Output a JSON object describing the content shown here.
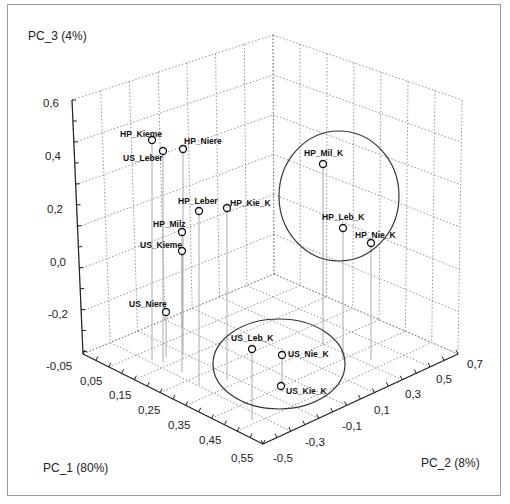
{
  "chart_data": {
    "type": "scatter3d",
    "title": "",
    "axes": {
      "x": {
        "label": "PC_1  (80%)",
        "ticks": [
          "-0,05",
          "0,05",
          "0,15",
          "0,25",
          "0,35",
          "0,45",
          "0,55"
        ],
        "range": [
          -0.05,
          0.6
        ]
      },
      "y": {
        "label": "PC_2  (8%)",
        "ticks": [
          "-0,5",
          "-0,3",
          "-0,1",
          "0,1",
          "0,3",
          "0,5",
          "0,7"
        ],
        "range": [
          -0.5,
          0.8
        ]
      },
      "z": {
        "label": "PC_3  (4%)",
        "ticks": [
          "0,6",
          "0,4",
          "0,2",
          "0,0",
          "-0,2"
        ],
        "range": [
          -0.35,
          0.6
        ]
      }
    },
    "grid": true,
    "points": [
      {
        "label": "HP_Kieme",
        "sx": 152,
        "sy": 140,
        "floor_y": 360
      },
      {
        "label": "US_Leber",
        "sx": 163,
        "sy": 151,
        "floor_y": 362
      },
      {
        "label": "HP_Niere",
        "sx": 183,
        "sy": 149,
        "floor_y": 355
      },
      {
        "label": "HP_Leber",
        "sx": 199,
        "sy": 211,
        "floor_y": 385
      },
      {
        "label": "HP_Kie_K",
        "sx": 227,
        "sy": 208,
        "floor_y": 380
      },
      {
        "label": "HP_Milz",
        "sx": 182,
        "sy": 232,
        "floor_y": 372
      },
      {
        "label": "US_Kieme",
        "sx": 182,
        "sy": 251,
        "floor_y": 328
      },
      {
        "label": "US_Niere",
        "sx": 166,
        "sy": 312,
        "floor_y": 357
      },
      {
        "label": "HP_Mil_K",
        "sx": 323,
        "sy": 164,
        "floor_y": 345
      },
      {
        "label": "HP_Leb_K",
        "sx": 343,
        "sy": 228,
        "floor_y": 360
      },
      {
        "label": "HP_Nie_K",
        "sx": 371,
        "sy": 243,
        "floor_y": 360
      },
      {
        "label": "US_Leb_K",
        "sx": 252,
        "sy": 349,
        "floor_y": 420
      },
      {
        "label": "US_Nie_K",
        "sx": 282,
        "sy": 355,
        "floor_y": 392
      },
      {
        "label": "US_Kie_K",
        "sx": 281,
        "sy": 386,
        "floor_y": 386
      }
    ],
    "groups": [
      {
        "name": "HP_K cluster",
        "members": [
          "HP_Mil_K",
          "HP_Leb_K",
          "HP_Nie_K"
        ],
        "ellipse": {
          "cx": 339,
          "cy": 196,
          "rx": 60,
          "ry": 65
        }
      },
      {
        "name": "US_K cluster",
        "members": [
          "US_Leb_K",
          "US_Nie_K",
          "US_Kie_K"
        ],
        "ellipse": {
          "cx": 279,
          "cy": 364,
          "rx": 66,
          "ry": 45
        }
      }
    ]
  },
  "labels": {
    "z_title": "PC_3  (4%)",
    "x_title": "PC_1  (80%)",
    "y_title": "PC_2  (8%)",
    "z_ticks": [
      "0,6",
      "0,4",
      "0,2",
      "0,0",
      "-0,2"
    ],
    "x_ticks": [
      "-0,05",
      "0,05",
      "0,15",
      "0,25",
      "0,35",
      "0,45",
      "0,55"
    ],
    "y_ticks": [
      "-0,5",
      "-0,3",
      "-0,1",
      "0,1",
      "0,3",
      "0,5",
      "0,7"
    ],
    "points": [
      "HP_Kieme",
      "US_Leber",
      "HP_Niere",
      "HP_Leber",
      "HP_Kie_K",
      "HP_Milz",
      "US_Kieme",
      "US_Niere",
      "HP_Mil_K",
      "HP_Leb_K",
      "HP_Nie_K",
      "US_Leb_K",
      "US_Nie_K",
      "US_Kie_K"
    ]
  }
}
